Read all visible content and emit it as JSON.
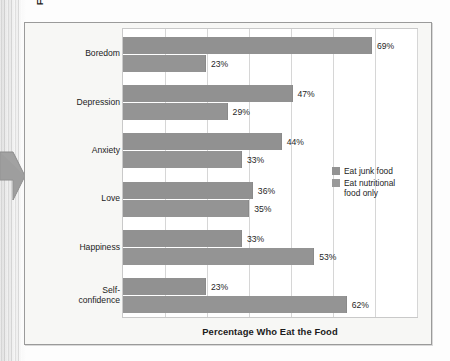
{
  "chart_data": {
    "type": "bar",
    "orientation": "horizontal",
    "title": "",
    "xlabel": "Percentage Who Eat the Food",
    "ylabel": "Feeling That Triggers Eating",
    "categories": [
      "Boredom",
      "Depression",
      "Anxiety",
      "Love",
      "Happiness",
      "Self-\nconfidence"
    ],
    "series": [
      {
        "name": "Eat junk food",
        "values": [
          69,
          47,
          44,
          36,
          33,
          23
        ],
        "color": "#919191"
      },
      {
        "name": "Eat nutritional food only",
        "values": [
          23,
          29,
          33,
          35,
          53,
          62
        ],
        "color": "#949494"
      }
    ],
    "data_labels": [
      [
        "69%",
        "23%"
      ],
      [
        "47%",
        "29%"
      ],
      [
        "44%",
        "33%"
      ],
      [
        "36%",
        "35%"
      ],
      [
        "33%",
        "53%"
      ],
      [
        "23%",
        "62%"
      ]
    ],
    "xlim": [
      0,
      81.5
    ],
    "gridlines_x": [
      0,
      11.64,
      23.29,
      34.93,
      46.57,
      58.21,
      69.86,
      81.5
    ],
    "grid": true,
    "tick_labels_x": [],
    "legend_position": "inside-right"
  },
  "figure": {
    "y_axis_title": "Feeling That Triggers Eating",
    "x_axis_title": "Percentage Who Eat the Food",
    "categories": [
      {
        "line1": "Boredom",
        "line2": ""
      },
      {
        "line1": "Depression",
        "line2": ""
      },
      {
        "line1": "Anxiety",
        "line2": ""
      },
      {
        "line1": "Love",
        "line2": ""
      },
      {
        "line1": "Happiness",
        "line2": ""
      },
      {
        "line1": "Self-",
        "line2": "confidence"
      }
    ],
    "labels": {
      "g0b0": "69%",
      "g0b1": "23%",
      "g1b0": "47%",
      "g1b1": "29%",
      "g2b0": "44%",
      "g2b1": "33%",
      "g3b0": "36%",
      "g3b1": "35%",
      "g4b0": "33%",
      "g4b1": "53%",
      "g5b0": "23%",
      "g5b1": "62%"
    },
    "legend": {
      "item1": "Eat junk food",
      "item2_line1": "Eat nutritional",
      "item2_line2": "food only"
    },
    "colors": {
      "bar_junk": "#919191",
      "bar_nutritional": "#949494",
      "gridline": "#d6d6d6",
      "frame": "#9a9a9a",
      "plot_border": "#c9c9c9",
      "text": "#1c1c1c",
      "figure_bg": "#f7f7f5",
      "pointer": "#9d9d9d"
    }
  }
}
